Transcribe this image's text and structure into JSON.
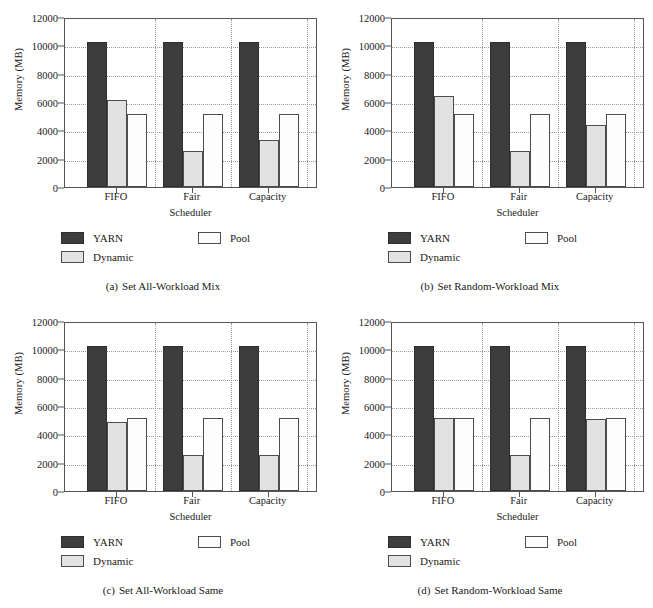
{
  "figure": {
    "panel_count": 4,
    "shared": {
      "ylabel": "Memory (MB)",
      "xlabel": "Scheduler",
      "categories": [
        "FIFO",
        "Fair",
        "Capacity"
      ],
      "yticks": [
        0,
        2000,
        4000,
        6000,
        8000,
        10000,
        12000
      ],
      "ylim": [
        0,
        12000
      ],
      "legend": [
        {
          "name": "YARN",
          "color": "#3d3d3d"
        },
        {
          "name": "Pool",
          "color": "#fdfdfd"
        },
        {
          "name": "Dynamic",
          "color": "#e2e2e2"
        }
      ]
    }
  },
  "chart_data": [
    {
      "type": "bar",
      "panel": "a",
      "title": "Set All-Workload Mix",
      "caption_tag": "(a)",
      "caption_text": "Set All-Workload Mix",
      "xlabel": "Scheduler",
      "ylabel": "Memory (MB)",
      "ylim": [
        0,
        12000
      ],
      "yticks": [
        0,
        2000,
        4000,
        6000,
        8000,
        10000,
        12000
      ],
      "grid": true,
      "legend_position": "below-plot",
      "categories": [
        "FIFO",
        "Fair",
        "Capacity"
      ],
      "series": [
        {
          "name": "YARN",
          "values": [
            10240,
            10240,
            10240
          ]
        },
        {
          "name": "Dynamic",
          "values": [
            6144,
            2560,
            3328
          ]
        },
        {
          "name": "Pool",
          "values": [
            5120,
            5120,
            5120
          ]
        }
      ]
    },
    {
      "type": "bar",
      "panel": "b",
      "title": "Set Random-Workload Mix",
      "caption_tag": "(b)",
      "caption_text": "Set Random-Workload Mix",
      "xlabel": "Scheduler",
      "ylabel": "Memory (MB)",
      "ylim": [
        0,
        12000
      ],
      "yticks": [
        0,
        2000,
        4000,
        6000,
        8000,
        10000,
        12000
      ],
      "grid": true,
      "legend_position": "below-plot",
      "categories": [
        "FIFO",
        "Fair",
        "Capacity"
      ],
      "series": [
        {
          "name": "YARN",
          "values": [
            10240,
            10240,
            10240
          ]
        },
        {
          "name": "Dynamic",
          "values": [
            6400,
            2560,
            4352
          ]
        },
        {
          "name": "Pool",
          "values": [
            5120,
            5120,
            5120
          ]
        }
      ]
    },
    {
      "type": "bar",
      "panel": "c",
      "title": "Set All-Workload Same",
      "caption_tag": "(c)",
      "caption_text": "Set All-Workload Same",
      "xlabel": "Scheduler",
      "ylabel": "Memory (MB)",
      "ylim": [
        0,
        12000
      ],
      "yticks": [
        0,
        2000,
        4000,
        6000,
        8000,
        10000,
        12000
      ],
      "grid": true,
      "legend_position": "below-plot",
      "categories": [
        "FIFO",
        "Fair",
        "Capacity"
      ],
      "series": [
        {
          "name": "YARN",
          "values": [
            10240,
            10240,
            10240
          ]
        },
        {
          "name": "Dynamic",
          "values": [
            4864,
            2560,
            2560
          ]
        },
        {
          "name": "Pool",
          "values": [
            5120,
            5120,
            5120
          ]
        }
      ]
    },
    {
      "type": "bar",
      "panel": "d",
      "title": "Set Random-Workload Same",
      "caption_tag": "(d)",
      "caption_text": "Set Random-Workload Same",
      "xlabel": "Scheduler",
      "ylabel": "Memory (MB)",
      "ylim": [
        0,
        12000
      ],
      "yticks": [
        0,
        2000,
        4000,
        6000,
        8000,
        10000,
        12000
      ],
      "grid": true,
      "legend_position": "below-plot",
      "categories": [
        "FIFO",
        "Fair",
        "Capacity"
      ],
      "series": [
        {
          "name": "YARN",
          "values": [
            10240,
            10240,
            10240
          ]
        },
        {
          "name": "Dynamic",
          "values": [
            5120,
            2560,
            5056
          ]
        },
        {
          "name": "Pool",
          "values": [
            5120,
            5120,
            5120
          ]
        }
      ]
    }
  ]
}
